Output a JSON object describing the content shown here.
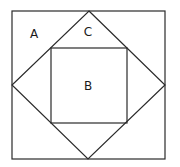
{
  "diagram": {
    "type": "nested-squares",
    "stroke_color": "#2a2a2a",
    "background_color": "#ffffff",
    "shapes": {
      "outer_square": {
        "x": 12,
        "y": 11,
        "width": 153,
        "height": 148
      },
      "diamond": {
        "top": [
          89,
          11
        ],
        "right": [
          165,
          85
        ],
        "bottom": [
          88,
          159
        ],
        "left": [
          12,
          85
        ]
      },
      "inner_square": {
        "x": 51,
        "y": 48,
        "width": 76,
        "height": 75
      }
    },
    "labels": [
      {
        "id": "A",
        "text": "A",
        "x": 34,
        "y": 34,
        "region": "corner triangle between outer square and diamond"
      },
      {
        "id": "C",
        "text": "C",
        "x": 88,
        "y": 32,
        "region": "triangle between diamond and inner square"
      },
      {
        "id": "B",
        "text": "B",
        "x": 88,
        "y": 86,
        "region": "inner square"
      }
    ]
  }
}
